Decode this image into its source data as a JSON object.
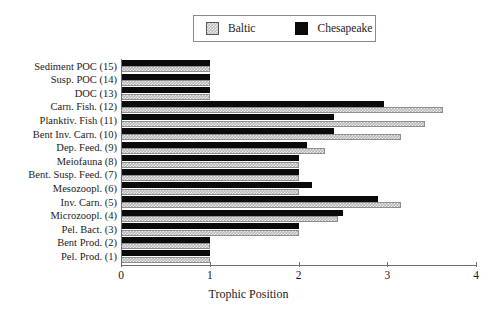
{
  "legend": {
    "entries": [
      {
        "label": "Baltic",
        "swatch": "hatched-gray",
        "color": "#bdbdbd"
      },
      {
        "label": "Chesapeake",
        "swatch": "solid-black",
        "color": "#0a0a0a"
      }
    ]
  },
  "axis": {
    "x_title": "Trophic Position",
    "ticks": [
      "0",
      "1",
      "2",
      "3",
      "4"
    ]
  },
  "chart_data": {
    "type": "bar",
    "orientation": "horizontal",
    "title": "",
    "xlabel": "Trophic Position",
    "ylabel": "",
    "xlim": [
      0,
      4
    ],
    "grid": false,
    "legend_position": "top-center",
    "categories": [
      "Sediment POC (15)",
      "Susp. POC (14)",
      "DOC (13)",
      "Carn. Fish. (12)",
      "Planktiv. Fish (11)",
      "Bent Inv. Carn. (10)",
      "Dep. Feed. (9)",
      "Meiofauna (8)",
      "Bent. Susp. Feed. (7)",
      "Mesozoopl. (6)",
      "Inv. Carn. (5)",
      "Microzoopl. (4)",
      "Pel. Bact. (3)",
      "Bent Prod. (2)",
      "Pel. Prod. (1)"
    ],
    "series": [
      {
        "name": "Baltic",
        "color": "#bdbdbd",
        "values": [
          1.0,
          1.0,
          1.0,
          3.63,
          3.42,
          3.15,
          2.3,
          2.0,
          2.0,
          2.0,
          3.15,
          2.45,
          2.0,
          1.0,
          1.0
        ]
      },
      {
        "name": "Chesapeake",
        "color": "#0a0a0a",
        "values": [
          1.0,
          1.0,
          1.0,
          2.96,
          2.4,
          2.4,
          2.1,
          2.0,
          2.0,
          2.15,
          2.9,
          2.5,
          2.0,
          1.0,
          1.0
        ]
      }
    ]
  }
}
